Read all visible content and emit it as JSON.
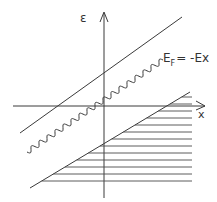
{
  "diagram": {
    "type": "band-diagram-sketch",
    "axes": {
      "y_label": "ε",
      "x_label": "x",
      "y_axis_x": 104,
      "x_axis_y": 106
    },
    "labels": {
      "fermi_level": "E",
      "fermi_subscript": "F",
      "fermi_rhs": "= -Ex"
    },
    "lines": {
      "upper_band_edge": {
        "x1": 20,
        "y1": 133,
        "x2": 182,
        "y2": 17
      },
      "lower_band_edge": {
        "x1": 30,
        "y1": 188,
        "x2": 190,
        "y2": 92
      },
      "fermi_level_wavy": {
        "x1": 27,
        "y1": 152,
        "x2": 163,
        "y2": 60
      }
    },
    "hatching": {
      "region": "filled states below lower band edge",
      "right_edge_x": 192,
      "rows_y": [
        97,
        104,
        111,
        118,
        125,
        132,
        139,
        146,
        153,
        160,
        167,
        174,
        181
      ]
    },
    "colors": {
      "ink": "#3a3a3a",
      "background": "#ffffff"
    }
  }
}
